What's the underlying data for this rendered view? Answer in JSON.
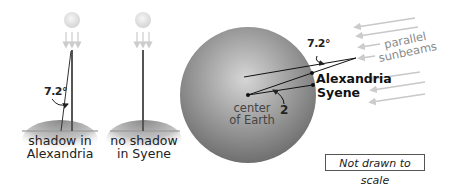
{
  "left_panel": {
    "angle_label": "7.2°",
    "ground_label_line1": "shadow in",
    "ground_label_line2": "Alexandria"
  },
  "middle_panel": {
    "ground_label_line1": "no shadow",
    "ground_label_line2": "in Syene"
  },
  "earth_panel": {
    "angle_top_label": "7.2°",
    "angle_center_label": "2",
    "center_label_line1": "center",
    "center_label_line2": "of Earth",
    "city_1": "Alexandria",
    "city_2": "Syene",
    "sunbeams_label_line1": "parallel",
    "sunbeams_label_line2": "sunbeams"
  },
  "note": "Not drawn to scale",
  "colors": {
    "sun": "#e6e6e6",
    "stick": "#555555",
    "earth_light": "#cfcfcf",
    "earth_dark": "#6e6e6e",
    "sunbeam": "#c8c8c8"
  }
}
